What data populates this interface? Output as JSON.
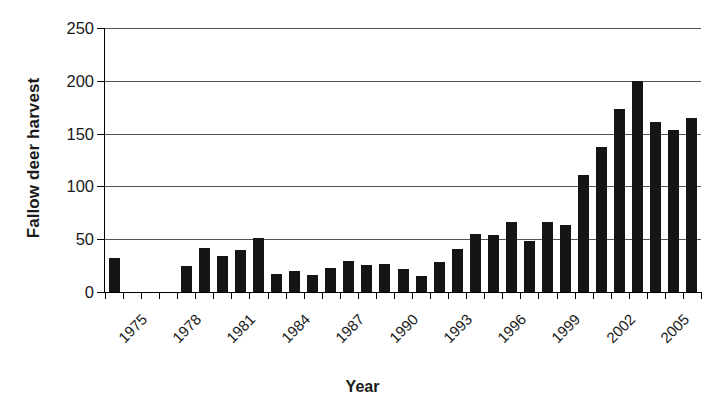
{
  "chart_data": {
    "type": "bar",
    "title": "",
    "xlabel": "Year",
    "ylabel": "Fallow deer harvest",
    "ylim": [
      0,
      250
    ],
    "yticks": [
      0,
      50,
      100,
      150,
      200,
      250
    ],
    "grid": true,
    "legend": "none",
    "bar_color": "#151515",
    "categories": [
      "1975",
      "1976",
      "1977",
      "1978",
      "1979",
      "1980",
      "1981",
      "1982",
      "1983",
      "1984",
      "1985",
      "1986",
      "1987",
      "1988",
      "1989",
      "1990",
      "1991",
      "1992",
      "1993",
      "1994",
      "1995",
      "1996",
      "1997",
      "1998",
      "1999",
      "2000",
      "2001",
      "2002",
      "2003",
      "2004",
      "2005",
      "2006",
      "2007"
    ],
    "values": [
      32,
      0,
      0,
      0,
      25,
      42,
      34,
      40,
      51,
      17,
      20,
      16,
      23,
      29,
      26,
      27,
      22,
      15,
      28,
      41,
      55,
      54,
      66,
      48,
      66,
      63,
      111,
      137,
      173,
      200,
      161,
      153,
      165
    ],
    "xtick_labels": [
      "1975",
      "1978",
      "1981",
      "1984",
      "1987",
      "1990",
      "1993",
      "1996",
      "1999",
      "2002",
      "2005"
    ],
    "xtick_indices": [
      0,
      3,
      6,
      9,
      12,
      15,
      18,
      21,
      24,
      27,
      30
    ],
    "xtick_label_rotation": -45
  }
}
